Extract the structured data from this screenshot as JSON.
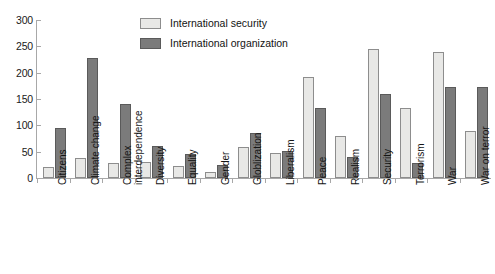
{
  "chart_data": {
    "type": "bar",
    "title": "",
    "subtitle": "",
    "xlabel": "",
    "ylabel": "",
    "ylim": [
      0,
      300
    ],
    "yticks": [
      0,
      50,
      100,
      150,
      200,
      250,
      300
    ],
    "grid": false,
    "legend_position": "top-center",
    "categories": [
      "Citizens",
      "Climate change",
      "Complex\ninterdependence",
      "Diversity",
      "Equality",
      "Gender",
      "Globlization",
      "Liberalism",
      "Peace",
      "Realism",
      "Security",
      "Terrorism",
      "War",
      "War on terror"
    ],
    "series": [
      {
        "name": "International security",
        "color": "#e8e8e6",
        "values": [
          20,
          38,
          28,
          30,
          22,
          12,
          58,
          48,
          192,
          80,
          245,
          133,
          240,
          90
        ]
      },
      {
        "name": "International organization",
        "color": "#7b7b7b",
        "values": [
          95,
          228,
          140,
          60,
          45,
          25,
          85,
          52,
          133,
          40,
          159,
          28,
          172,
          172
        ]
      }
    ]
  },
  "legend": {
    "entries": [
      {
        "label": "International security",
        "swatch": "light"
      },
      {
        "label": "International organization",
        "swatch": "dark"
      }
    ]
  },
  "axis": {
    "y_tick_labels": [
      "300",
      "250",
      "200",
      "150",
      "100",
      "50",
      "0"
    ]
  }
}
